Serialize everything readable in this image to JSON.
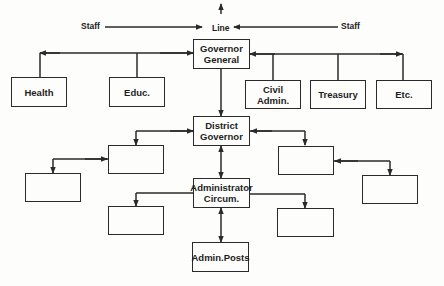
{
  "diagram": {
    "type": "organization-chart",
    "top_labels": {
      "staff_left": "Staff",
      "line": "Line",
      "staff_right": "Staff"
    },
    "nodes": {
      "governor_general": "Governor\nGeneral",
      "health": "Health",
      "education": "Educ.",
      "civil_admin": "Civil Admin.",
      "treasury": "Treasury",
      "etc": "Etc.",
      "district_governor": "District\nGovernor",
      "administrator_circum": "Administrator\nCircum.",
      "admin_posts": "Admin.Posts",
      "district_staff_left_1": "",
      "district_staff_left_2": "",
      "district_staff_right_1": "",
      "district_staff_right_2": "",
      "circum_staff_left": "",
      "circum_staff_right": ""
    },
    "edges": [
      {
        "from": "governor_general",
        "to": "district_governor",
        "style": "line"
      },
      {
        "from": "district_governor",
        "to": "administrator_circum",
        "style": "bidirectional"
      },
      {
        "from": "administrator_circum",
        "to": "admin_posts",
        "style": "bidirectional"
      },
      {
        "from": "governor_general",
        "to": "health",
        "style": "staff"
      },
      {
        "from": "governor_general",
        "to": "education",
        "style": "staff"
      },
      {
        "from": "governor_general",
        "to": "civil_admin",
        "style": "staff"
      },
      {
        "from": "governor_general",
        "to": "treasury",
        "style": "staff"
      },
      {
        "from": "governor_general",
        "to": "etc",
        "style": "staff"
      },
      {
        "from": "district_governor",
        "to": "district_staff_left_1",
        "style": "staff"
      },
      {
        "from": "district_staff_left_1",
        "to": "district_staff_left_2",
        "style": "staff"
      },
      {
        "from": "district_governor",
        "to": "district_staff_right_1",
        "style": "staff"
      },
      {
        "from": "district_staff_right_1",
        "to": "district_staff_right_2",
        "style": "staff"
      },
      {
        "from": "administrator_circum",
        "to": "circum_staff_left",
        "style": "staff"
      },
      {
        "from": "administrator_circum",
        "to": "circum_staff_right",
        "style": "staff"
      }
    ],
    "colors": {
      "ink": "#2a2a2a",
      "paper": "#fdfdfb"
    }
  }
}
